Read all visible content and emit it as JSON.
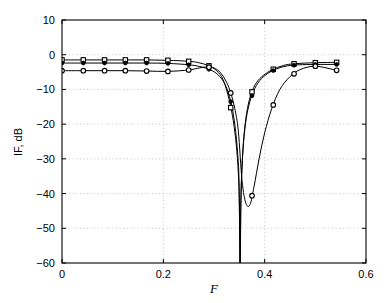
{
  "chart_data": {
    "type": "line",
    "title": "",
    "xlabel": "F",
    "ylabel": "IF, dB",
    "xlim": [
      0,
      0.6
    ],
    "ylim": [
      -60,
      10
    ],
    "grid": true,
    "legend": "none",
    "xticks": [
      0,
      0.2,
      0.4,
      0.6
    ],
    "xtick_labels": [
      "0",
      "0.2",
      "0.4",
      "0.6"
    ],
    "yticks": [
      10,
      0,
      -10,
      -20,
      -30,
      -40,
      -50,
      -60
    ],
    "ytick_labels": [
      "10",
      "0",
      "-10",
      "-20",
      "-30",
      "-40",
      "-50",
      "-60"
    ],
    "series": [
      {
        "name": "narrow-notch-square",
        "marker": "square",
        "x": [
          0,
          0.042,
          0.084,
          0.125,
          0.167,
          0.209,
          0.25,
          0.27,
          0.29,
          0.305,
          0.318,
          0.33,
          0.338,
          0.344,
          0.348,
          0.35,
          0.3515,
          0.353,
          0.356,
          0.36,
          0.366,
          0.374,
          0.384,
          0.397,
          0.415,
          0.437,
          0.459,
          0.5,
          0.542
        ],
        "y": [
          -1.5,
          -1.5,
          -1.5,
          -1.5,
          -1.5,
          -1.6,
          -1.9,
          -2.3,
          -3.2,
          -4.6,
          -7.2,
          -13.0,
          -19.0,
          -26.0,
          -34.0,
          -43.0,
          -60.0,
          -42.0,
          -30.0,
          -22.0,
          -15.5,
          -11.0,
          -8.0,
          -6.0,
          -4.3,
          -3.1,
          -2.6,
          -2.3,
          -2.2
        ]
      },
      {
        "name": "narrow-notch-dot",
        "marker": "dot",
        "x": [
          0,
          0.042,
          0.084,
          0.125,
          0.167,
          0.209,
          0.25,
          0.272,
          0.292,
          0.308,
          0.322,
          0.333,
          0.341,
          0.347,
          0.3495,
          0.3515,
          0.3535,
          0.357,
          0.362,
          0.369,
          0.378,
          0.39,
          0.405,
          0.423,
          0.445,
          0.468,
          0.5,
          0.542
        ],
        "y": [
          -2.4,
          -2.4,
          -2.4,
          -2.4,
          -2.4,
          -2.5,
          -2.9,
          -3.4,
          -4.3,
          -5.8,
          -8.6,
          -13.5,
          -20.0,
          -29.0,
          -37.0,
          -60.0,
          -40.0,
          -28.0,
          -20.0,
          -14.5,
          -10.5,
          -7.5,
          -5.5,
          -4.1,
          -3.2,
          -2.9,
          -2.8,
          -2.8
        ]
      },
      {
        "name": "wide-notch-circle",
        "marker": "circle",
        "x": [
          0,
          0.042,
          0.084,
          0.125,
          0.167,
          0.209,
          0.25,
          0.268,
          0.286,
          0.3,
          0.313,
          0.325,
          0.333,
          0.341,
          0.348,
          0.3555,
          0.363,
          0.371,
          0.379,
          0.389,
          0.4,
          0.414,
          0.43,
          0.45,
          0.47,
          0.5,
          0.542
        ],
        "y": [
          -4.6,
          -4.6,
          -4.6,
          -4.6,
          -4.7,
          -4.8,
          -4.4,
          -3.9,
          -3.5,
          -3.8,
          -5.2,
          -8.0,
          -11.0,
          -15.5,
          -22.0,
          -36.5,
          -42.8,
          -43.2,
          -38.0,
          -30.0,
          -22.5,
          -15.5,
          -10.0,
          -6.3,
          -4.3,
          -3.3,
          -4.5
        ]
      }
    ],
    "marker_x_positions": [
      0,
      0.042,
      0.084,
      0.125,
      0.167,
      0.209,
      0.25,
      0.29,
      0.333,
      0.375,
      0.417,
      0.458,
      0.5,
      0.542
    ],
    "notch_center_narrow": 0.3515,
    "notch_center_wide": 0.367,
    "notch_depth_narrow_db": -60,
    "notch_depth_wide_db": -43.2,
    "passband_levels_db": [
      -1.5,
      -2.4,
      -4.6
    ]
  },
  "colors": {
    "axis": "#000000",
    "grid": "#b4b4b4",
    "curve": "#000000",
    "background": "#ffffff"
  }
}
